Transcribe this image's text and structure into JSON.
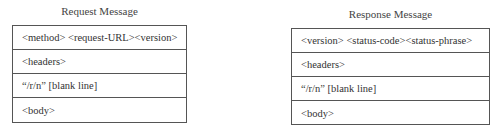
{
  "request": {
    "title": "Request Message",
    "rows": [
      "<method> <request-URL><version>",
      "<headers>",
      "“/r/n” [blank line]",
      "<body>"
    ]
  },
  "response": {
    "title": "Response Message",
    "rows": [
      "<version> <status-code><status-phrase>",
      "<headers>",
      "“/r/n” [blank line]",
      "<body>"
    ]
  }
}
